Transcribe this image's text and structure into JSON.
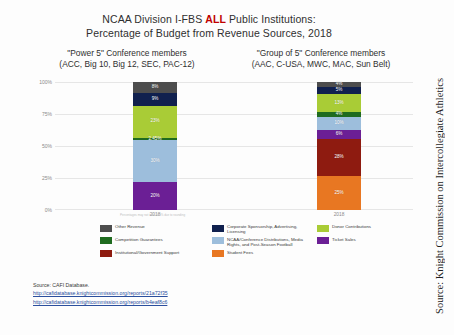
{
  "title": {
    "line1_pre": "NCAA Division I-FBS ",
    "line1_hl": "ALL",
    "line1_post": " Public Institutions:",
    "line2": "Percentage of Budget from Revenue Sources, 2018"
  },
  "subheads": [
    {
      "line1": "\"Power 5\" Conference members",
      "line2": "(ACC, Big 10, Big 12, SEC, PAC-12)"
    },
    {
      "line1": "\"Group of 5\" Conference members",
      "line2": "(AAC, C-USA, MWC, MAC, Sun Belt)"
    }
  ],
  "tiny_note": "Percentages may not total 100% due to rounding",
  "legend": [
    {
      "label": "Other Revenue",
      "color": "#4d4d4d"
    },
    {
      "label": "Corporate Sponsorship, Advertising, Licensing",
      "color": "#10204e"
    },
    {
      "label": "Donor Contributions",
      "color": "#a9cc36"
    },
    {
      "label": "Competition Guarantees",
      "color": "#1f6b1f"
    },
    {
      "label": "NCAA/Conference Distributions, Media Rights, and Post-Season Football",
      "color": "#9dbedc"
    },
    {
      "label": "Ticket Sales",
      "color": "#6b1f95"
    },
    {
      "label": "Institutional/Government Support",
      "color": "#8e1b10"
    },
    {
      "label": "Student Fees",
      "color": "#e87722"
    }
  ],
  "source": {
    "label": "Source: CAFI Database.",
    "url1": "http://cafidatabase.knightcommission.org/reports/21a72f35",
    "url2": "http://cafidatabase.knightcommission.org/reports/b4eaf8c6"
  },
  "side_credit": "Source: Knight Commission on Intercollegiate Athletics",
  "chart_data": {
    "type": "bar",
    "stacked": true,
    "normalized": true,
    "title": "NCAA Division I-FBS ALL Public Institutions: Percentage of Budget from Revenue Sources, 2018",
    "xlabel": "",
    "ylabel": "",
    "ylim": [
      0,
      100
    ],
    "ytick_labels": [
      "100%",
      "75%",
      "50%",
      "25%",
      "0%"
    ],
    "ytick_values": [
      100,
      75,
      50,
      25,
      0
    ],
    "grid": true,
    "legend_position": "bottom",
    "categories": [
      "2018",
      "2018"
    ],
    "groups": [
      "\"Power 5\" Conference members",
      "\"Group of 5\" Conference members"
    ],
    "series": [
      {
        "name": "Student Fees",
        "color": "#e87722",
        "values": [
          0,
          25
        ],
        "labels": [
          "",
          "25%"
        ]
      },
      {
        "name": "Institutional/Government Support",
        "color": "#8e1b10",
        "values": [
          0,
          28
        ],
        "labels": [
          "",
          "28%"
        ]
      },
      {
        "name": "Ticket Sales",
        "color": "#6b1f95",
        "values": [
          20,
          6
        ],
        "labels": [
          "20%",
          "6%"
        ]
      },
      {
        "name": "NCAA/Conference Distributions, Media Rights, and Post-Season Football",
        "color": "#9dbedc",
        "values": [
          30,
          10
        ],
        "labels": [
          "30%",
          "10%"
        ]
      },
      {
        "name": "Competition Guarantees",
        "color": "#1f6b1f",
        "values": [
          2,
          4
        ],
        "labels": [
          "2.45%",
          "4%"
        ]
      },
      {
        "name": "Donor Contributions",
        "color": "#a9cc36",
        "values": [
          23,
          13
        ],
        "labels": [
          "23%",
          "13%"
        ]
      },
      {
        "name": "Corporate Sponsorship, Advertising, Licensing",
        "color": "#10204e",
        "values": [
          9,
          5
        ],
        "labels": [
          "9%",
          "5%"
        ]
      },
      {
        "name": "Other Revenue",
        "color": "#4d4d4d",
        "values": [
          8,
          4
        ],
        "labels": [
          "8%",
          "4%"
        ]
      }
    ]
  }
}
